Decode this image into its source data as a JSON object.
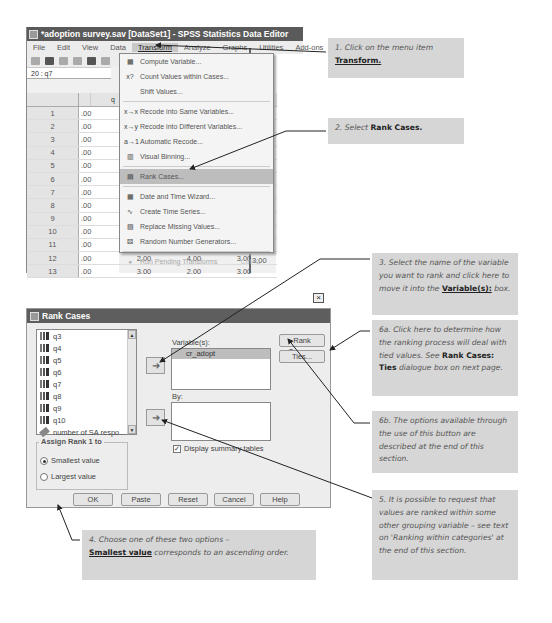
{
  "editor": {
    "title": "*adoption survey.sav [DataSet1] - SPSS Statistics Data Editor",
    "menu": [
      "File",
      "Edit",
      "View",
      "Data",
      "Transform",
      "Analyze",
      "Graphs",
      "Utilities",
      "Add-ons",
      "W"
    ],
    "active_menu": "Transform",
    "cell_ref": "20 : q7",
    "column_header": "q",
    "rows": [
      {
        "n": "1",
        "c1": ".00",
        "c2": "",
        "c3": "",
        "c4": "",
        "c5": "3.00"
      },
      {
        "n": "2",
        "c1": ".00",
        "c2": "",
        "c3": "",
        "c4": "",
        "c5": "2.00"
      },
      {
        "n": "3",
        "c1": ".00",
        "c2": "",
        "c3": "",
        "c4": "",
        "c5": "1.00"
      },
      {
        "n": "4",
        "c1": ".00",
        "c2": "",
        "c3": "",
        "c4": "",
        "c5": "3.00"
      },
      {
        "n": "5",
        "c1": ".00",
        "c2": "",
        "c3": "",
        "c4": "",
        "c5": "4.00"
      },
      {
        "n": "6",
        "c1": ".00",
        "c2": "",
        "c3": "",
        "c4": "",
        "c5": "1.00"
      },
      {
        "n": "7",
        "c1": ".00",
        "c2": "",
        "c3": "",
        "c4": "",
        "c5": "1.00"
      },
      {
        "n": "8",
        "c1": ".00",
        "c2": "",
        "c3": "",
        "c4": "",
        "c5": "2.00"
      },
      {
        "n": "9",
        "c1": ".00",
        "c2": "",
        "c3": "",
        "c4": "",
        "c5": "1.00"
      },
      {
        "n": "10",
        "c1": ".00",
        "c2": "",
        "c3": "",
        "c4": "",
        "c5": "2.00"
      },
      {
        "n": "11",
        "c1": ".00",
        "c2": "",
        "c3": "",
        "c4": "",
        "c5": "5.00"
      },
      {
        "n": "12",
        "c1": ".00",
        "c2": "2.00",
        "c3": "4.00",
        "c4": "3.00",
        "c5": "4.00"
      },
      {
        "n": "13",
        "c1": ".00",
        "c2": "3.00",
        "c3": "2.00",
        "c4": "3.00",
        "c5": "3.00"
      }
    ]
  },
  "transform_menu": {
    "items": [
      {
        "icon": "compute-icon",
        "glyph": "▦",
        "label": "Compute Variable..."
      },
      {
        "icon": "count-icon",
        "glyph": "x?",
        "label": "Count Values within Cases..."
      },
      {
        "icon": "",
        "glyph": "",
        "label": "Shift Values..."
      },
      {
        "icon": "recode-same-icon",
        "glyph": "x→x",
        "label": "Recode into Same Variables..."
      },
      {
        "icon": "recode-different-icon",
        "glyph": "x→y",
        "label": "Recode into Different Variables..."
      },
      {
        "icon": "automatic-recode-icon",
        "glyph": "a→1",
        "label": "Automatic Recode..."
      },
      {
        "icon": "visual-binning-icon",
        "glyph": "▥",
        "label": "Visual Binning..."
      },
      {
        "icon": "rank-cases-icon",
        "glyph": "▤",
        "label": "Rank Cases..."
      },
      {
        "icon": "date-time-icon",
        "glyph": "▦",
        "label": "Date and Time Wizard..."
      },
      {
        "icon": "time-series-icon",
        "glyph": "∿",
        "label": "Create Time Series..."
      },
      {
        "icon": "replace-missing-icon",
        "glyph": "▧",
        "label": "Replace Missing Values..."
      },
      {
        "icon": "random-number-icon",
        "glyph": "⚄",
        "label": "Random Number Generators..."
      },
      {
        "icon": "run-pending-icon",
        "glyph": "●",
        "label": "Run Pending Transforms",
        "shortcut": "Ctrl+G"
      }
    ],
    "selected": "Rank Cases..."
  },
  "dialog": {
    "title": "Rank Cases",
    "source_vars": [
      "q3",
      "q4",
      "q5",
      "q6",
      "q7",
      "q8",
      "q9",
      "q10",
      "number of SA respo..."
    ],
    "variables_label": "Variable(s):",
    "variables": [
      "cr_adopt"
    ],
    "by_label": "By:",
    "rank_types_button": "Rank Types...",
    "ties_button": "Ties...",
    "display_summary_label": "Display summary tables",
    "display_summary_checked": true,
    "assign_rank_legend": "Assign Rank 1 to",
    "radio_smallest": "Smallest value",
    "radio_largest": "Largest value",
    "selected_radio": "Smallest value",
    "buttons": {
      "ok": "OK",
      "paste": "Paste",
      "reset": "Reset",
      "cancel": "Cancel",
      "help": "Help"
    }
  },
  "callouts": {
    "c1_text": "1. Click on the menu item",
    "c1_bold": "Transform.",
    "c2_text": "2. Select",
    "c2_bold": "Rank Cases.",
    "c3_text": "3. Select the name of the variable you want to rank and click here to move it into the",
    "c3_bold": "Variable(s):",
    "c3_tail": "box.",
    "c6a_text": "6a. Click here to determine how the ranking process will deal with tied values. See",
    "c6a_bold": "Rank Cases: Ties",
    "c6a_tail": "dialogue box on next page.",
    "c6b_text": "6b. The options available through the use of this button are described at the end of this section.",
    "c5_text": "5. It is possible to request that values are ranked within some other grouping variable – see text on 'Ranking within categories' at the end of this section.",
    "c4_text": "4. Choose one of these two options –",
    "c4_bold": "Smallest value",
    "c4_tail": "corresponds to an ascending order."
  }
}
